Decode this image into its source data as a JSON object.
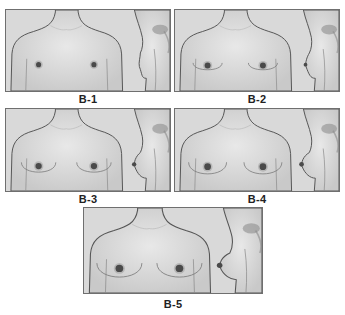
{
  "figure": {
    "colors": {
      "background": "#ffffff",
      "panel_fill": "#d9d9d9",
      "skin_fill": "#e2e2e2",
      "outline": "#555555",
      "areola": "#4a4a4a",
      "border": "#6f6f6f"
    },
    "panels": [
      {
        "label": "B-1",
        "stage": 1,
        "breast_size": 0.0,
        "areola_r": 2.6
      },
      {
        "label": "B-2",
        "stage": 2,
        "breast_size": 0.3,
        "areola_r": 3.0
      },
      {
        "label": "B-3",
        "stage": 3,
        "breast_size": 0.6,
        "areola_r": 3.2
      },
      {
        "label": "B-4",
        "stage": 4,
        "breast_size": 0.8,
        "areola_r": 3.4
      },
      {
        "label": "B-5",
        "stage": 5,
        "breast_size": 1.0,
        "areola_r": 3.6
      }
    ]
  }
}
